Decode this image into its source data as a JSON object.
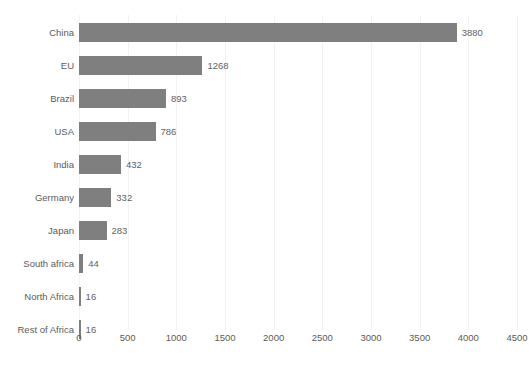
{
  "chart_data": {
    "type": "bar",
    "orientation": "horizontal",
    "title": "",
    "xlabel": "",
    "ylabel": "",
    "categories": [
      "China",
      "EU",
      "Brazil",
      "USA",
      "India",
      "Germany",
      "Japan",
      "South africa",
      "North Africa",
      "Rest of Africa"
    ],
    "values": [
      3880,
      1268,
      893,
      786,
      432,
      332,
      283,
      44,
      16,
      16
    ],
    "data_labels": [
      "3880",
      "1268",
      "893",
      "786",
      "432",
      "332",
      "283",
      "44",
      "16",
      "16"
    ],
    "xlim": [
      0,
      4500
    ],
    "xticks": [
      0,
      500,
      1000,
      1500,
      2000,
      2500,
      3000,
      3500,
      4000,
      4500
    ],
    "xtick_labels": [
      "0",
      "500",
      "1000",
      "1500",
      "2000",
      "2500",
      "3000",
      "3500",
      "4000",
      "4500"
    ],
    "grid": true,
    "grid_axis": "x",
    "legend": false,
    "series": [
      {
        "name": "",
        "color": "#7f7f7f",
        "values": [
          3880,
          1268,
          893,
          786,
          432,
          332,
          283,
          44,
          16,
          16
        ]
      }
    ],
    "colors": {
      "bar": "#7f7f7f",
      "gridline": "#f2f2f2",
      "label_text": "#5b5b5b",
      "value_text": "#5f5f5f",
      "background": "#ffffff"
    }
  }
}
